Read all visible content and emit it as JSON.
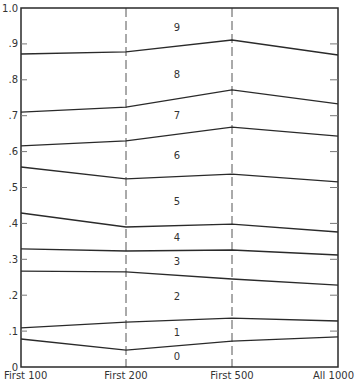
{
  "chart_data": {
    "type": "line",
    "title": "",
    "xlabel": "",
    "ylabel": "",
    "categories": [
      "First 100",
      "First 200",
      "First 500",
      "All 1000"
    ],
    "ylim": [
      0,
      1.0
    ],
    "y_ticks": [
      "0",
      ".1",
      ".2",
      ".3",
      ".4",
      ".5",
      ".6",
      ".7",
      ".8",
      ".9",
      "1.0"
    ],
    "y_tick_values": [
      0,
      0.1,
      0.2,
      0.3,
      0.4,
      0.5,
      0.6,
      0.7,
      0.8,
      0.9,
      1.0
    ],
    "grid": false,
    "vertical_dashed_lines_at": [
      "First 200",
      "First 500"
    ],
    "legend": "none",
    "series": [
      {
        "name": "boundary 0/1",
        "values": [
          0.078,
          0.047,
          0.072,
          0.084
        ]
      },
      {
        "name": "boundary 1/2",
        "values": [
          0.109,
          0.125,
          0.136,
          0.128
        ]
      },
      {
        "name": "boundary 2/3",
        "values": [
          0.267,
          0.265,
          0.245,
          0.228
        ]
      },
      {
        "name": "boundary 3/4",
        "values": [
          0.329,
          0.323,
          0.326,
          0.312
        ]
      },
      {
        "name": "boundary 4/5",
        "values": [
          0.429,
          0.39,
          0.398,
          0.376
        ]
      },
      {
        "name": "boundary 5/6",
        "values": [
          0.557,
          0.524,
          0.537,
          0.516
        ]
      },
      {
        "name": "boundary 6/7",
        "values": [
          0.616,
          0.63,
          0.668,
          0.643
        ]
      },
      {
        "name": "boundary 7/8",
        "values": [
          0.71,
          0.724,
          0.772,
          0.733
        ]
      },
      {
        "name": "boundary 8/9",
        "values": [
          0.872,
          0.878,
          0.911,
          0.869
        ]
      }
    ],
    "band_labels": [
      {
        "label": "0",
        "y": 0.03
      },
      {
        "label": "1",
        "y": 0.095
      },
      {
        "label": "2",
        "y": 0.195
      },
      {
        "label": "3",
        "y": 0.295
      },
      {
        "label": "4",
        "y": 0.36
      },
      {
        "label": "5",
        "y": 0.462
      },
      {
        "label": "6",
        "y": 0.588
      },
      {
        "label": "7",
        "y": 0.7
      },
      {
        "label": "8",
        "y": 0.816
      },
      {
        "label": "9",
        "y": 0.947
      }
    ]
  },
  "colors": {
    "line": "#2a2a2a",
    "axis": "#2a2a2a",
    "dashed": "#555555",
    "text": "#333333",
    "background": "#ffffff"
  }
}
